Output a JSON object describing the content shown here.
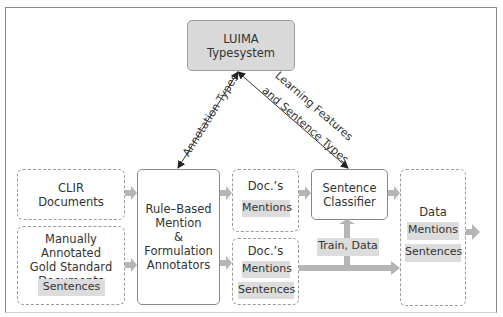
{
  "diagram": {
    "typesystem": {
      "line1": "LUIMA",
      "line2": "Typesystem"
    },
    "edge_labels": {
      "annotation_types": "Annotation Types",
      "learning_line1": "Learning Features",
      "learning_line2": "and Sentence Types"
    },
    "clir": {
      "line1": "CLIR",
      "line2": "Documents"
    },
    "manual": {
      "line1": "Manually Annotated",
      "line2": "Gold Standard",
      "line3": "Documents",
      "chip": "Sentences"
    },
    "annotators": {
      "line1": "Rule–Based",
      "line2": "Mention",
      "line3": "& Formulation",
      "line4": "Annotators"
    },
    "docs1": {
      "title": "Doc.’s",
      "chip": "Mentions"
    },
    "docs2": {
      "title": "Doc.’s",
      "chip1": "Mentions",
      "chip2": "Sentences"
    },
    "classifier": {
      "line1": "Sentence",
      "line2": "Classifier"
    },
    "train_chip": "Train, Data",
    "data": {
      "title": "Data",
      "chip1": "Mentions",
      "chip2": "Sentences"
    },
    "colors": {
      "chip": "#dcdcdc",
      "typesystem_fill": "#d9d9d9",
      "flow_arrow": "#b5b5b5",
      "border": "#8a8a8a"
    }
  }
}
